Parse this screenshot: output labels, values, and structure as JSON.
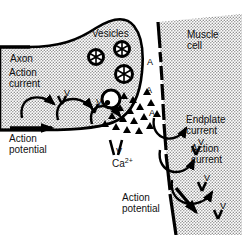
{
  "figure": {
    "background": "#ffffff",
    "ink": "#000000",
    "stipple_tone": "#b9b9b9"
  },
  "labels": {
    "axon": "Axon",
    "action_current_left": "Action\ncurrent",
    "vesicles": "Vesicles",
    "muscle_cell": "Muscle\ncell",
    "action_potential_left": "Action\npotential",
    "calcium": "Ca",
    "calcium_charge": "2+",
    "endplate_current": "Endplate\ncurrent",
    "action_current_right": "Action\ncurrent",
    "action_potential_bottom": "Action\npotential"
  },
  "channels": {
    "voltage_gated_symbol": "V",
    "ach_receptor_symbol": "A",
    "voltage_gated_marks": [
      {
        "x": 64,
        "y": 88
      },
      {
        "x": 96,
        "y": 97
      },
      {
        "x": 116,
        "y": 146
      },
      {
        "x": 198,
        "y": 137
      },
      {
        "x": 204,
        "y": 173
      },
      {
        "x": 220,
        "y": 201
      }
    ],
    "ach_receptor_marks": [
      {
        "x": 147,
        "y": 57
      },
      {
        "x": 146,
        "y": 85
      },
      {
        "x": 149,
        "y": 108
      }
    ]
  },
  "vesicles": [
    {
      "cx": 96,
      "cy": 57,
      "r": 7.5
    },
    {
      "cx": 122,
      "cy": 49,
      "r": 7.5
    },
    {
      "cx": 124,
      "cy": 74,
      "r": 8.5
    },
    {
      "cx": 111,
      "cy": 99,
      "r": 9.0
    }
  ],
  "transmitter_particles": {
    "shape": "triangle",
    "count": 17,
    "description": "acetylcholine molecules released into synaptic cleft"
  },
  "arrows": {
    "action_potential_left": "straight arrow pointing right",
    "action_potential_bottom": "straight arrow pointing down-right",
    "current_loops": "curved loop arrows through membrane channels"
  }
}
